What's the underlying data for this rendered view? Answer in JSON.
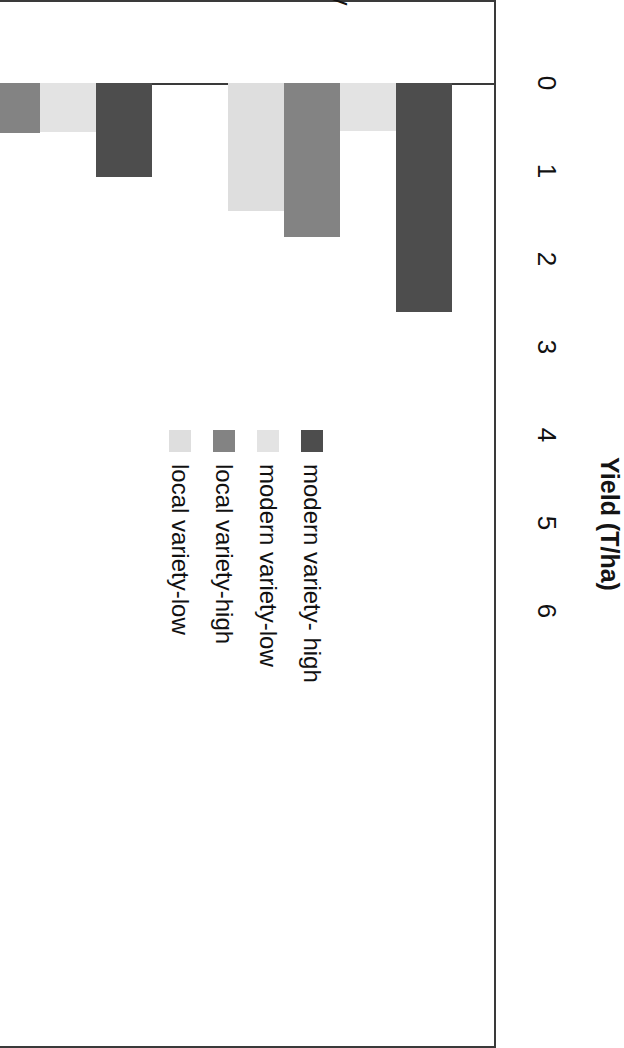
{
  "chart_data": {
    "type": "bar",
    "orientation": "horizontal",
    "title": "Yield (T/ha)",
    "xlabel": "Yield (T/ha)",
    "ylabel": "",
    "categories": [
      "Barley",
      "Rice",
      "Wheat"
    ],
    "series": [
      {
        "name": "modern variety- high",
        "color": "#4d4d4d",
        "values": [
          2.6,
          1.07,
          5.45
        ]
      },
      {
        "name": "modern variety-low",
        "color": "#e3e3e3",
        "values": [
          0.55,
          0.56,
          4.65
        ]
      },
      {
        "name": "local variety-high",
        "color": "#838383",
        "values": [
          1.75,
          0.57,
          3.45
        ]
      },
      {
        "name": "local variety-low",
        "color": "#dedede",
        "values": [
          1.45,
          0.7,
          4.03
        ]
      }
    ],
    "tick_labels": [
      "0",
      "1",
      "2",
      "3",
      "4",
      "5",
      "6"
    ],
    "xlim": [
      0,
      6
    ],
    "grid": false,
    "legend_position": "inside-right",
    "axis_color": "#3a3a3a",
    "background": "#ffffff"
  },
  "legend": {
    "items": [
      {
        "label": "modern variety- high"
      },
      {
        "label": "modern variety-low"
      },
      {
        "label": "local variety-high"
      },
      {
        "label": "local variety-low"
      }
    ]
  }
}
